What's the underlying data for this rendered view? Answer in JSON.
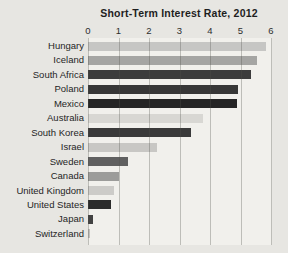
{
  "figure": {
    "background": "#e7e6e2",
    "plot_background": "#f1f0ec",
    "gridline_color": "#b5b4b0",
    "text_color": "#252525"
  },
  "chart_data": {
    "type": "bar",
    "orientation": "horizontal",
    "title": "Short-Term Interest Rate, 2012",
    "xlabel": "",
    "ylabel": "",
    "xlim": [
      0,
      6
    ],
    "x_ticks": [
      "0",
      "1",
      "2",
      "3",
      "4",
      "5",
      "6"
    ],
    "grid": true,
    "legend": false,
    "categories": [
      "Hungary",
      "Iceland",
      "South Africa",
      "Poland",
      "Mexico",
      "Australia",
      "South Korea",
      "Israel",
      "Sweden",
      "Canada",
      "United Kingdom",
      "United States",
      "Japan",
      "Switzerland"
    ],
    "values": [
      5.8,
      5.5,
      5.3,
      4.9,
      4.85,
      3.75,
      3.35,
      2.25,
      1.3,
      1.0,
      0.85,
      0.75,
      0.15,
      0.05
    ],
    "bar_colors": [
      "#c6c6c4",
      "#a5a5a3",
      "#3c3c3c",
      "#373737",
      "#252525",
      "#d8d7d3",
      "#3a3a3a",
      "#c8c7c4",
      "#606060",
      "#9c9c9a",
      "#cccbc8",
      "#2b2b2b",
      "#424242",
      "#c2c1be"
    ]
  }
}
